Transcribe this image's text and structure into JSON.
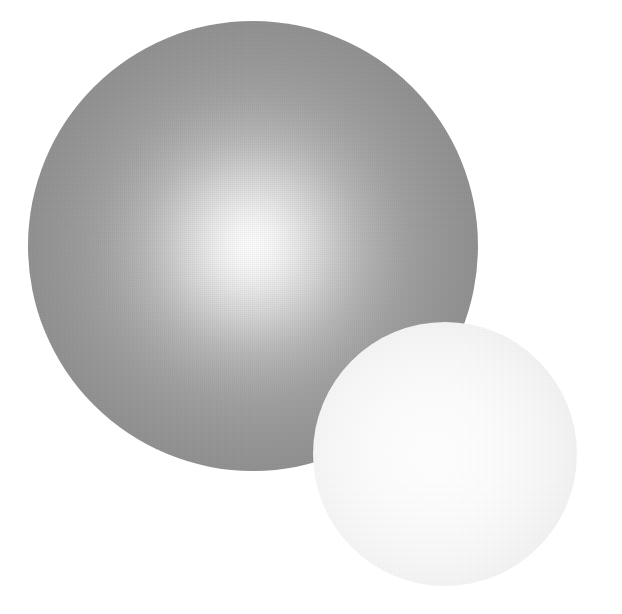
{
  "scene": {
    "title": "Two shaded spheres",
    "background_color": "#ffffff",
    "width": 622,
    "height": 614
  },
  "objects": [
    {
      "name": "large-sphere",
      "shape": "circle",
      "center_x": 253,
      "center_y": 246,
      "radius": 225,
      "highlight_x": 253,
      "highlight_y": 246,
      "highlight_color": "#fdfdfd",
      "edge_color": "#8c8c8c",
      "z_order": 1
    },
    {
      "name": "small-sphere",
      "shape": "circle",
      "center_x": 445,
      "center_y": 454,
      "radius": 132,
      "highlight_x": 435,
      "highlight_y": 454,
      "highlight_color": "#ffffff",
      "edge_color": "#eaeaea",
      "z_order": 2
    }
  ]
}
